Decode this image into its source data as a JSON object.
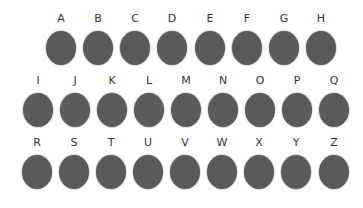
{
  "colors": {
    "dot": "#5a5a5a",
    "label": "#333333",
    "background": "#ffffff"
  },
  "rows": [
    {
      "top": 12,
      "items": [
        {
          "label": "A",
          "x": 61
        },
        {
          "label": "B",
          "x": 98
        },
        {
          "label": "C",
          "x": 135
        },
        {
          "label": "D",
          "x": 172
        },
        {
          "label": "E",
          "x": 210
        },
        {
          "label": "F",
          "x": 247
        },
        {
          "label": "G",
          "x": 284
        },
        {
          "label": "H",
          "x": 321
        }
      ]
    },
    {
      "top": 74,
      "items": [
        {
          "label": "I",
          "x": 38
        },
        {
          "label": "J",
          "x": 75
        },
        {
          "label": "K",
          "x": 112
        },
        {
          "label": "L",
          "x": 149
        },
        {
          "label": "M",
          "x": 186
        },
        {
          "label": "N",
          "x": 223
        },
        {
          "label": "O",
          "x": 260
        },
        {
          "label": "P",
          "x": 297
        },
        {
          "label": "Q",
          "x": 334
        }
      ]
    },
    {
      "top": 136,
      "items": [
        {
          "label": "R",
          "x": 37
        },
        {
          "label": "S",
          "x": 74
        },
        {
          "label": "T",
          "x": 111
        },
        {
          "label": "U",
          "x": 148
        },
        {
          "label": "V",
          "x": 185
        },
        {
          "label": "W",
          "x": 222
        },
        {
          "label": "X",
          "x": 259
        },
        {
          "label": "Y",
          "x": 296
        },
        {
          "label": "Z",
          "x": 334
        }
      ]
    }
  ]
}
